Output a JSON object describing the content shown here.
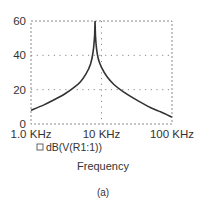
{
  "chart_data": {
    "type": "line",
    "title": "",
    "xlabel": "Frequency",
    "ylabel": "",
    "xscale": "log",
    "xlim": [
      1000,
      100000
    ],
    "ylim": [
      0,
      60
    ],
    "grid": true,
    "x_tick_labels": [
      "1.0 KHz",
      "10 KHz",
      "100 KHz"
    ],
    "x_tick_values": [
      1000,
      10000,
      100000
    ],
    "y_tick_labels": [
      "0",
      "20",
      "40",
      "60"
    ],
    "y_tick_values": [
      0,
      20,
      40,
      60
    ],
    "legend_position": "bottom-left",
    "series": [
      {
        "name": "dB(V(R1:1))",
        "color": "#333333",
        "x": [
          1000,
          1500,
          2000,
          3000,
          4000,
          5000,
          6000,
          7000,
          7600,
          8000,
          8100,
          8200,
          8500,
          9000,
          10000,
          12000,
          15000,
          20000,
          30000,
          50000,
          70000,
          100000
        ],
        "values": [
          8,
          11,
          13.5,
          17.5,
          21,
          24.5,
          29,
          35,
          42,
          52,
          60,
          52,
          44,
          38,
          33,
          27.5,
          23,
          19,
          14.5,
          9.5,
          7,
          4
        ]
      }
    ],
    "caption": "(a)"
  },
  "legend": {
    "marker": "square-outline-icon",
    "label": "dB(V(R1:1))"
  },
  "axis": {
    "xlabel": "Frequency"
  },
  "caption": "(a)"
}
